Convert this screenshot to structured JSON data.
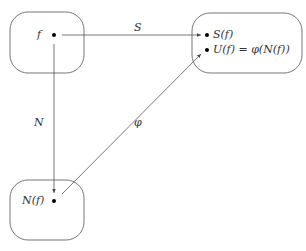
{
  "diagram": {
    "nodes": [
      {
        "id": "f",
        "label": "f"
      },
      {
        "id": "outputs",
        "items": [
          "S(f)",
          "U(f) = φ(N(f))"
        ]
      },
      {
        "id": "Nf",
        "label": "N(f)"
      }
    ],
    "edges": [
      {
        "from": "f",
        "to": "S(f)",
        "label": "S"
      },
      {
        "from": "f",
        "to": "N(f)",
        "label": "N"
      },
      {
        "from": "N(f)",
        "to": "U(f)",
        "label": "φ"
      }
    ]
  },
  "colors": {
    "stroke": "#555555",
    "dot": "#000000",
    "text": "#333333"
  }
}
